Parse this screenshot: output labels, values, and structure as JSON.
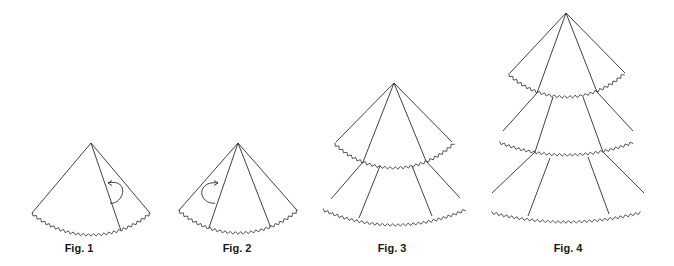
{
  "figures": [
    {
      "id": "fig1",
      "label": "Fig. 1",
      "tiers": 1,
      "fold_lines": 1,
      "arrow": "right-fold"
    },
    {
      "id": "fig2",
      "label": "Fig. 2",
      "tiers": 1,
      "fold_lines": 2,
      "arrow": "left-fold"
    },
    {
      "id": "fig3",
      "label": "Fig. 3",
      "tiers": 2,
      "fold_lines": 2,
      "arrow": null
    },
    {
      "id": "fig4",
      "label": "Fig. 4",
      "tiers": 3,
      "fold_lines": 2,
      "arrow": null
    }
  ],
  "colors": {
    "line": "#2b2b2b",
    "background": "#ffffff"
  }
}
